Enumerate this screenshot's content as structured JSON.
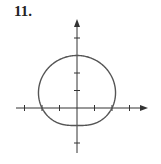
{
  "problem": {
    "number_label": "11."
  },
  "chart_data": {
    "type": "line",
    "title": "",
    "equation": "r = 2 + sin(θ)",
    "xlabel": "",
    "ylabel": "",
    "xlim": [
      -3,
      4
    ],
    "ylim": [
      -2,
      5
    ],
    "x_ticks": [
      -3,
      -2,
      -1,
      1,
      2,
      3
    ],
    "y_ticks": [
      -2,
      -1,
      1,
      2,
      3,
      4
    ],
    "key_points": [
      {
        "x": 0,
        "y": 3
      },
      {
        "x": 0,
        "y": -1
      },
      {
        "x": 2,
        "y": 0
      },
      {
        "x": -2,
        "y": 0
      }
    ],
    "grid": false,
    "colors": {
      "curve": "#555555",
      "axis": "#333333"
    }
  },
  "layout": {
    "origin_px": [
      77,
      108
    ],
    "unit_px": 17.5
  }
}
